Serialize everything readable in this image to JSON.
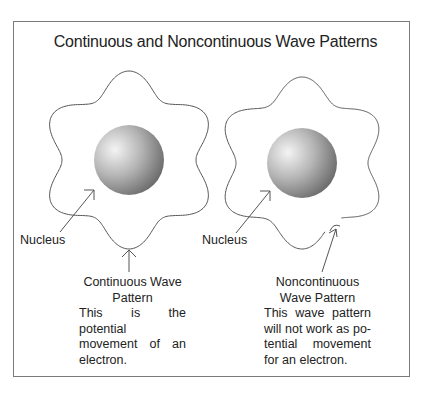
{
  "figure": {
    "title": "Continuous and Noncontinuous Wave Patterns",
    "left_panel": {
      "nucleus_label": "Nucleus",
      "caption_heading_line1": "Continuous Wave",
      "caption_heading_line2": "Pattern",
      "caption_body": "This is the potential movement of an electron.",
      "wave_type": "continuous"
    },
    "right_panel": {
      "nucleus_label": "Nucleus",
      "caption_heading_line1": "Noncontinuous",
      "caption_heading_line2": "Wave Pattern",
      "caption_body": "This wave pattern will not work as po- tential movement for an electron.",
      "wave_type": "noncontinuous"
    },
    "colors": {
      "line": "#555555",
      "frame": "#7a7a7a",
      "nucleus_light": "#f4f4f4",
      "nucleus_dark": "#6a6a6a"
    }
  }
}
